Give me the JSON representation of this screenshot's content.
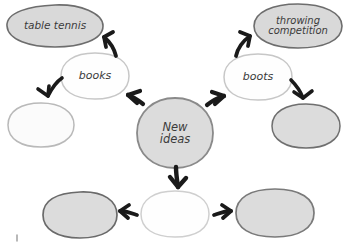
{
  "diagram": {
    "colors": {
      "fill_gray": "#d9d9d9",
      "fill_white": "#fefefe",
      "stroke_dark": "#6b6b6b",
      "stroke_light": "#c9c9c9",
      "stroke_center": "#8a8a8a",
      "text": "#3b3b3b",
      "arrow": "#1a1a1a",
      "background": "#ffffff"
    },
    "center_node": {
      "id": "center",
      "label": "New\nideas",
      "shape": "circle",
      "fill": "filled",
      "cx": 175,
      "cy": 133,
      "rx": 38,
      "ry": 35
    },
    "nodes": [
      {
        "id": "table-tennis",
        "label": "table tennis",
        "shape": "ellipse",
        "fill": "filled",
        "cx": 55,
        "cy": 26,
        "rx": 48,
        "ry": 21
      },
      {
        "id": "books",
        "label": "books",
        "shape": "ellipse",
        "fill": "empty",
        "cx": 95,
        "cy": 76,
        "rx": 34,
        "ry": 23
      },
      {
        "id": "left-middle-blank",
        "label": "",
        "shape": "ellipse",
        "fill": "empty",
        "cx": 41,
        "cy": 125,
        "rx": 33,
        "ry": 22
      },
      {
        "id": "throwing-competition",
        "label": "throwing\ncompetition",
        "shape": "ellipse",
        "fill": "filled",
        "cx": 298,
        "cy": 26,
        "rx": 44,
        "ry": 22
      },
      {
        "id": "boots",
        "label": "boots",
        "shape": "ellipse",
        "fill": "empty",
        "cx": 258,
        "cy": 77,
        "rx": 34,
        "ry": 23
      },
      {
        "id": "right-middle-blank",
        "label": "",
        "shape": "ellipse",
        "fill": "filled",
        "cx": 306,
        "cy": 126,
        "rx": 34,
        "ry": 22
      },
      {
        "id": "bottom-left-blank",
        "label": "",
        "shape": "ellipse",
        "fill": "filled",
        "cx": 80,
        "cy": 215,
        "rx": 37,
        "ry": 23
      },
      {
        "id": "bottom-center-blank",
        "label": "",
        "shape": "ellipse",
        "fill": "empty",
        "cx": 175,
        "cy": 214,
        "rx": 34,
        "ry": 23
      },
      {
        "id": "bottom-right-blank",
        "label": "",
        "shape": "ellipse",
        "fill": "filled",
        "cx": 275,
        "cy": 213,
        "rx": 39,
        "ry": 24
      }
    ],
    "arrows": [
      {
        "id": "center-to-books",
        "from": "center",
        "to": "books",
        "direction": "up-left"
      },
      {
        "id": "books-to-table-tennis",
        "from": "books",
        "to": "table-tennis",
        "direction": "up-left"
      },
      {
        "id": "books-to-left-blank",
        "from": "books",
        "to": "left-middle-blank",
        "direction": "down-left"
      },
      {
        "id": "center-to-boots",
        "from": "center",
        "to": "boots",
        "direction": "up-right"
      },
      {
        "id": "boots-to-throwing",
        "from": "boots",
        "to": "throwing-competition",
        "direction": "up-right"
      },
      {
        "id": "boots-to-right-blank",
        "from": "boots",
        "to": "right-middle-blank",
        "direction": "down-right"
      },
      {
        "id": "center-to-bottom-center",
        "from": "center",
        "to": "bottom-center-blank",
        "direction": "down"
      },
      {
        "id": "bottom-center-to-left",
        "from": "bottom-center-blank",
        "to": "bottom-left-blank",
        "direction": "left"
      },
      {
        "id": "bottom-center-to-right",
        "from": "bottom-center-blank",
        "to": "bottom-right-blank",
        "direction": "right"
      }
    ]
  }
}
